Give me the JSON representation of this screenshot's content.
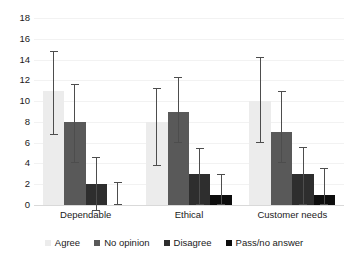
{
  "chart_data": {
    "type": "bar",
    "title": "",
    "xlabel": "",
    "ylabel": "",
    "ylim": [
      0,
      18
    ],
    "ytick_step": 2,
    "yticks": [
      0,
      2,
      4,
      6,
      8,
      10,
      12,
      14,
      16,
      18
    ],
    "ytick_labels": [
      "0",
      "2",
      "4",
      "6",
      "8",
      "10",
      "12",
      "14",
      "16",
      "18"
    ],
    "grid": true,
    "grid_axis": "y",
    "legend_position": "bottom",
    "error_bars": true,
    "categories": [
      "Dependable",
      "Ethical",
      "Customer needs"
    ],
    "series": [
      {
        "name": "Agree",
        "color": "#ececec",
        "values": [
          11,
          8,
          10
        ],
        "err_low": [
          4.3,
          4.2,
          4.0
        ],
        "err_high": [
          3.8,
          3.3,
          4.2
        ]
      },
      {
        "name": "No opinion",
        "color": "#595959",
        "values": [
          8,
          9,
          7
        ],
        "err_low": [
          4.0,
          3.0,
          3.0
        ],
        "err_high": [
          3.6,
          3.3,
          4.0
        ]
      },
      {
        "name": "Disagree",
        "color": "#2e2e2e",
        "values": [
          2,
          3,
          3
        ],
        "err_low": [
          2.6,
          3.0,
          3.0
        ],
        "err_high": [
          2.6,
          2.5,
          2.6
        ]
      },
      {
        "name": "Pass/no answer",
        "color": "#0d0d0d",
        "values": [
          0,
          1,
          1
        ],
        "err_low": [
          0.0,
          1.0,
          1.0
        ],
        "err_high": [
          2.2,
          2.0,
          2.6
        ]
      }
    ]
  },
  "legend": {
    "items": [
      {
        "label": "Agree",
        "color": "#ececec"
      },
      {
        "label": "No opinion",
        "color": "#595959"
      },
      {
        "label": "Disagree",
        "color": "#2e2e2e"
      },
      {
        "label": "Pass/no answer",
        "color": "#0d0d0d"
      }
    ]
  },
  "colors": {
    "background": "#ffffff",
    "text": "#1a1a1a",
    "gridline": "#f2f2f2",
    "baseline": "#d9d9d9",
    "errorbar": "#4d4d4d"
  }
}
